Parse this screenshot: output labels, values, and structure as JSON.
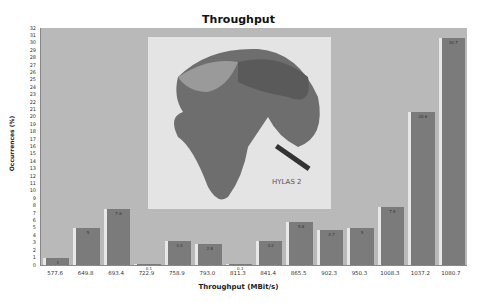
{
  "chart_data": {
    "type": "bar",
    "title": "Throughput",
    "xlabel": "Throughput (MBit/s)",
    "ylabel": "Occurrences (%)",
    "ylim": [
      0,
      32
    ],
    "yticks": [
      0,
      1,
      2,
      3,
      4,
      5,
      6,
      7,
      8,
      9,
      10,
      11,
      12,
      13,
      14,
      15,
      16,
      17,
      18,
      19,
      20,
      21,
      22,
      23,
      24,
      25,
      26,
      27,
      28,
      29,
      30,
      31,
      32
    ],
    "categories": [
      "577.6",
      "649.8",
      "693.4",
      "722.9",
      "758.9",
      "793.0",
      "811.3",
      "841.4",
      "865.5",
      "902.3",
      "950.3",
      "1008.3",
      "1037.2",
      "1080.7"
    ],
    "values": [
      1.0,
      5.0,
      7.6,
      0.1,
      3.3,
      2.8,
      0.1,
      3.2,
      5.8,
      4.7,
      5.0,
      7.9,
      20.6,
      30.7
    ],
    "grid": false,
    "legend": null,
    "annotations": [
      "HYLAS 2"
    ]
  },
  "inset": {
    "caption": "HYLAS 2",
    "description": "map of Europe, Africa and Middle East with satellite"
  }
}
